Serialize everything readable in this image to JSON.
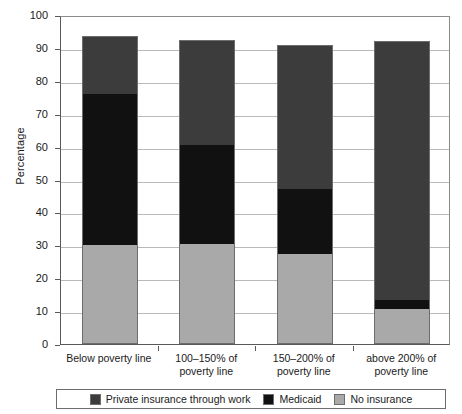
{
  "chart_data": {
    "type": "bar",
    "subtype": "stacked-bar",
    "title": "",
    "xlabel": "",
    "ylabel": "Percentage",
    "ylim": [
      0,
      100
    ],
    "yticks": [
      0,
      10,
      20,
      30,
      40,
      50,
      60,
      70,
      80,
      90,
      100
    ],
    "ytick_labels": [
      "0",
      "10",
      "20",
      "30",
      "40",
      "50",
      "60",
      "70",
      "80",
      "90",
      "100"
    ],
    "grid": true,
    "grid_axis": "y",
    "legend_position": "bottom",
    "categories": [
      "Below poverty line",
      "100–150% of poverty line",
      "150–200% of poverty line",
      "above 200% of poverty line"
    ],
    "category_lines": [
      [
        "Below poverty line"
      ],
      [
        "100–150% of",
        "poverty line"
      ],
      [
        "150–200% of",
        "poverty line"
      ],
      [
        "above 200% of",
        "poverty line"
      ]
    ],
    "series": [
      {
        "name": "No insurance",
        "color": "#a9a9a9",
        "values": [
          30,
          30.5,
          27.5,
          10.5
        ]
      },
      {
        "name": "Medicaid",
        "color": "#111111",
        "values": [
          46,
          30,
          19.5,
          3
        ]
      },
      {
        "name": "Private insurance through work",
        "color": "#3c3c3c",
        "values": [
          17.5,
          32,
          44,
          78.5
        ]
      }
    ],
    "stack_order": [
      "No insurance",
      "Medicaid",
      "Private insurance through work"
    ],
    "totals": [
      93.5,
      92.5,
      91,
      92
    ],
    "segment_boundaries": [
      {
        "category": "Below poverty line",
        "no_insurance": [
          0,
          30
        ],
        "medicaid": [
          30,
          76
        ],
        "private": [
          76,
          93.5
        ]
      },
      {
        "category": "100–150% of poverty line",
        "no_insurance": [
          0,
          30.5
        ],
        "medicaid": [
          30.5,
          60.5
        ],
        "private": [
          60.5,
          92.5
        ]
      },
      {
        "category": "150–200% of poverty line",
        "no_insurance": [
          0,
          27.5
        ],
        "medicaid": [
          27.5,
          47
        ],
        "private": [
          47,
          91
        ]
      },
      {
        "category": "above 200% of poverty line",
        "no_insurance": [
          0,
          10.5
        ],
        "medicaid": [
          10.5,
          13.5
        ],
        "private": [
          13.5,
          92
        ]
      }
    ]
  },
  "legend": {
    "items": [
      {
        "label": "Private insurance through work",
        "color": "#3c3c3c",
        "icon": "legend-swatch-private"
      },
      {
        "label": "Medicaid",
        "color": "#111111",
        "icon": "legend-swatch-medicaid"
      },
      {
        "label": "No insurance",
        "color": "#a9a9a9",
        "icon": "legend-swatch-no-insurance"
      }
    ]
  },
  "axis": {
    "y_title": "Percentage"
  }
}
